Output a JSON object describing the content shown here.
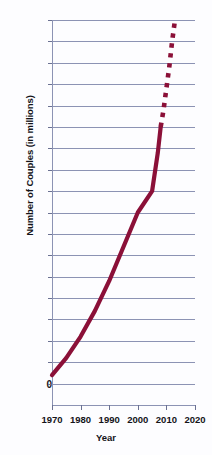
{
  "chart_data": {
    "type": "line",
    "title": "",
    "xlabel": "Year",
    "ylabel": "Number of Couples (in millions)",
    "xlim": [
      1970,
      2020
    ],
    "ylim": [
      0,
      9.0
    ],
    "grid": true,
    "legend": "none",
    "line_color": "#8b1038",
    "grid_color": "#8c93b4",
    "xticks": [
      1970,
      1980,
      1990,
      2000,
      2010,
      2020
    ],
    "xtick_labels": [
      "1970",
      "1980",
      "1990",
      "2000",
      "2010",
      "2020"
    ],
    "yticks": [
      0,
      0.5,
      1.0,
      1.5,
      2.0,
      2.5,
      3.0,
      3.5,
      4.0,
      4.5,
      5.0,
      5.5,
      6.0,
      6.5,
      7.0,
      7.5,
      8.0,
      8.5,
      9.0
    ],
    "ytick_labels": [
      "0",
      "0.5",
      "1.0",
      "1.5",
      "2.0",
      "2.5",
      "3.0",
      "3.5",
      "4.0",
      "4.5",
      "5.0",
      "5.5",
      "6.0",
      "6.5",
      "7.0",
      "7.5",
      "8.0",
      "8.5",
      "9.0"
    ],
    "series": [
      {
        "name": "Unmarried couples (observed)",
        "style": "solid",
        "x": [
          1970,
          1975,
          1980,
          1985,
          1990,
          1995,
          2000,
          2005,
          2007,
          2008
        ],
        "values": [
          0.7,
          1.1,
          1.6,
          2.2,
          2.9,
          3.7,
          4.5,
          5.0,
          5.9,
          6.5
        ]
      },
      {
        "name": "Unmarried couples (projected)",
        "style": "dotted",
        "x": [
          2008,
          2009,
          2010,
          2011,
          2012,
          2013
        ],
        "values": [
          6.5,
          6.9,
          7.4,
          7.9,
          8.5,
          9.0
        ]
      }
    ]
  }
}
